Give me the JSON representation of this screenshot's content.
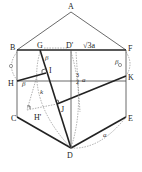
{
  "figure": {
    "type": "geometry-folding-diagram",
    "points": {
      "A": {
        "label": "A",
        "x": 71,
        "y": 12
      },
      "B": {
        "label": "B",
        "x": 17,
        "y": 50
      },
      "F": {
        "label": "F",
        "x": 126,
        "y": 50
      },
      "G": {
        "label": "G",
        "x": 40,
        "y": 50
      },
      "Dp": {
        "label": "D'",
        "x": 71,
        "y": 50
      },
      "H": {
        "label": "H",
        "x": 17,
        "y": 81
      },
      "K": {
        "label": "K",
        "x": 126,
        "y": 76
      },
      "I": {
        "label": "I",
        "x": 46,
        "y": 72
      },
      "C": {
        "label": "C",
        "x": 17,
        "y": 117
      },
      "E": {
        "label": "E",
        "x": 126,
        "y": 117
      },
      "J": {
        "label": "J",
        "x": 57,
        "y": 104
      },
      "Hp": {
        "label": "H'",
        "x": 27,
        "y": 110
      },
      "D": {
        "label": "D",
        "x": 71,
        "y": 148
      }
    },
    "annotations": {
      "top_length": "√3a",
      "dprime_dash": "—",
      "mid_fraction_num": "3",
      "mid_fraction_den": "2",
      "mid_var": "a",
      "beta_top": "β",
      "beta_left": "β",
      "beta_right": "β",
      "k_label": "k",
      "a_label": "a",
      "dash_left": "–"
    }
  }
}
